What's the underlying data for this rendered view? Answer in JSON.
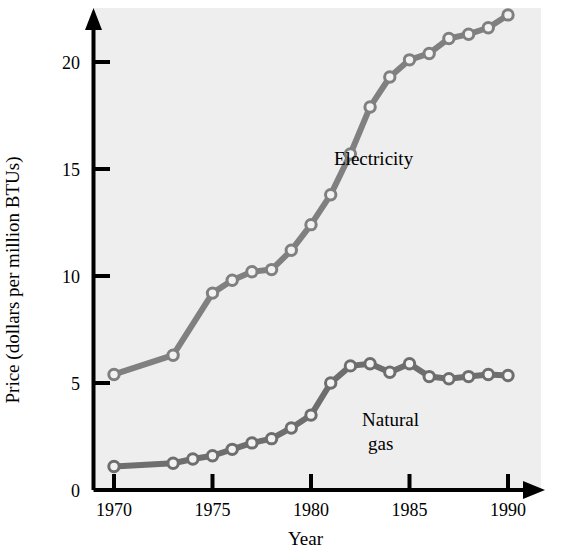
{
  "chart_data": {
    "type": "line",
    "title": "",
    "xlabel": "Year",
    "ylabel": "Price (dollars per million BTUs)",
    "xlim": [
      1969.2,
      1991.0
    ],
    "ylim": [
      0,
      23.0
    ],
    "xticks": [
      1970,
      1975,
      1980,
      1985,
      1990
    ],
    "yticks": [
      0,
      5,
      10,
      15,
      20
    ],
    "xtick_labels": [
      "1970",
      "1975",
      "1980",
      "1985",
      "1990"
    ],
    "ytick_labels": [
      "0",
      "5",
      "10",
      "15",
      "20"
    ],
    "grid": false,
    "legend_position": "inline-annotation",
    "marker": "open-circle",
    "series": [
      {
        "name": "Electricity",
        "color": "#808080",
        "annotation": "Electricity",
        "x": [
          1970,
          1973,
          1975,
          1976,
          1977,
          1978,
          1979,
          1980,
          1981,
          1982,
          1983,
          1984,
          1985,
          1986,
          1987,
          1988,
          1989,
          1990
        ],
        "values": [
          5.4,
          6.3,
          9.2,
          9.8,
          10.2,
          10.3,
          11.2,
          12.4,
          13.8,
          15.7,
          17.9,
          19.3,
          20.1,
          20.4,
          21.1,
          21.3,
          21.6,
          22.2
        ]
      },
      {
        "name": "Natural gas",
        "color": "#6e6e6e",
        "annotation": "Natural\ngas",
        "annotation_line1": "Natural",
        "annotation_line2": "gas",
        "x": [
          1970,
          1973,
          1974,
          1975,
          1976,
          1977,
          1978,
          1979,
          1980,
          1981,
          1982,
          1983,
          1984,
          1985,
          1986,
          1987,
          1988,
          1989,
          1990
        ],
        "values": [
          1.1,
          1.25,
          1.45,
          1.6,
          1.9,
          2.2,
          2.4,
          2.9,
          3.5,
          5.0,
          5.8,
          5.9,
          5.5,
          5.9,
          5.3,
          5.2,
          5.3,
          5.4,
          5.35
        ]
      }
    ]
  },
  "axis": {
    "x_axis_name": "year-axis",
    "y_axis_name": "price-axis",
    "arrow_heads": true
  }
}
